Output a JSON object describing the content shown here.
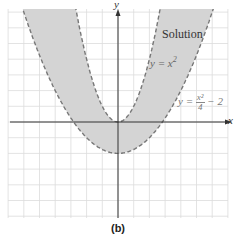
{
  "chart_data": {
    "type": "area",
    "title": "",
    "caption": "(b)",
    "xlabel": "x",
    "ylabel": "y",
    "xlim": [
      -7,
      7
    ],
    "ylim": [
      -6,
      7
    ],
    "grid": true,
    "grid_step": 1,
    "region_label": "Solution",
    "series": [
      {
        "name": "y = x^2",
        "equation": "y = x²",
        "style": "dashed",
        "boundary": "inner"
      },
      {
        "name": "y = x^2/4 - 2",
        "equation": "y = x²/4 − 2",
        "style": "dashed",
        "boundary": "outer"
      }
    ],
    "shaded_region": "x^2/4 - 2 < y < x^2",
    "key_points": [
      {
        "label": "vertex of y=x^2",
        "x": 0,
        "y": 0
      },
      {
        "label": "vertex of y=x^2/4-2",
        "x": 0,
        "y": -2
      },
      {
        "label": "x-intercepts of y=x^2/4-2",
        "x": [
          -2.83,
          2.83
        ],
        "y": 0
      }
    ],
    "colors": {
      "shade": "#d4d4d4",
      "curve": "#777777",
      "grid": "#dcdcdc",
      "axis": "#333333"
    }
  },
  "labels": {
    "solution": "Solution",
    "eq1_lhs": "y = x",
    "eq1_exp": "2",
    "eq2_lhs": "y = ",
    "eq2_num": "x²",
    "eq2_den": "4",
    "eq2_rhs": " − 2",
    "x_axis": "x",
    "y_axis": "y",
    "caption": "(b)"
  }
}
